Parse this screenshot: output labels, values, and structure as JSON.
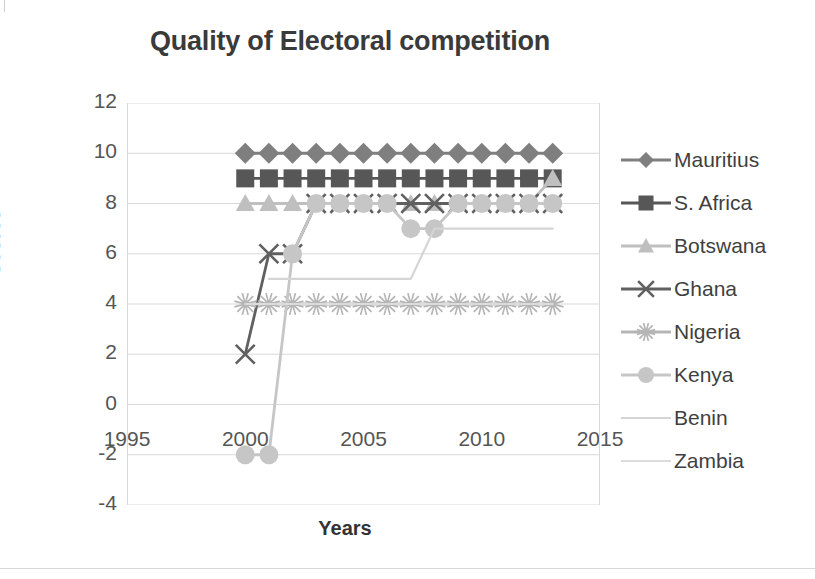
{
  "chart_data": {
    "type": "line",
    "title": "Quality of Electoral competition",
    "xlabel": "Years",
    "ylabel": "Scores",
    "xlim": [
      1995,
      2015
    ],
    "ylim": [
      -4,
      12
    ],
    "xticks": [
      "1995",
      "2000",
      "2005",
      "2010",
      "2015"
    ],
    "yticks": [
      "12",
      "10",
      "8",
      "6",
      "4",
      "2",
      "0",
      "-2",
      "-4"
    ],
    "grid": "horizontal",
    "legend_position": "right",
    "series": [
      {
        "name": "Mauritius",
        "marker": "diamond",
        "color": "#7f7f7f",
        "x": [
          2000,
          2001,
          2002,
          2003,
          2004,
          2005,
          2006,
          2007,
          2008,
          2009,
          2010,
          2011,
          2012,
          2013
        ],
        "values": [
          10,
          10,
          10,
          10,
          10,
          10,
          10,
          10,
          10,
          10,
          10,
          10,
          10,
          10
        ]
      },
      {
        "name": "S. Africa",
        "marker": "square",
        "color": "#575757",
        "x": [
          2000,
          2001,
          2002,
          2003,
          2004,
          2005,
          2006,
          2007,
          2008,
          2009,
          2010,
          2011,
          2012,
          2013
        ],
        "values": [
          9,
          9,
          9,
          9,
          9,
          9,
          9,
          9,
          9,
          9,
          9,
          9,
          9,
          9
        ]
      },
      {
        "name": "Botswana",
        "marker": "triangle",
        "color": "#bfbfbf",
        "x": [
          2000,
          2001,
          2002,
          2003,
          2004,
          2005,
          2006,
          2007,
          2008,
          2009,
          2010,
          2011,
          2012,
          2013
        ],
        "values": [
          8,
          8,
          8,
          8,
          8,
          8,
          8,
          8,
          8,
          8,
          8,
          8,
          8,
          9
        ]
      },
      {
        "name": "Ghana",
        "marker": "cross",
        "color": "#606060",
        "x": [
          2000,
          2001,
          2002,
          2003,
          2004,
          2005,
          2006,
          2007,
          2008,
          2009,
          2010,
          2011,
          2012,
          2013
        ],
        "values": [
          2,
          6,
          6,
          8,
          8,
          8,
          8,
          8,
          8,
          8,
          8,
          8,
          8,
          8
        ]
      },
      {
        "name": "Nigeria",
        "marker": "asterisk",
        "color": "#b5b5b5",
        "x": [
          2000,
          2001,
          2002,
          2003,
          2004,
          2005,
          2006,
          2007,
          2008,
          2009,
          2010,
          2011,
          2012,
          2013
        ],
        "values": [
          4,
          4,
          4,
          4,
          4,
          4,
          4,
          4,
          4,
          4,
          4,
          4,
          4,
          4
        ]
      },
      {
        "name": "Kenya",
        "marker": "circle",
        "color": "#c6c6c6",
        "x": [
          2000,
          2001,
          2002,
          2003,
          2004,
          2005,
          2006,
          2007,
          2008,
          2009,
          2010,
          2011,
          2012,
          2013
        ],
        "values": [
          -2,
          -2,
          6,
          8,
          8,
          8,
          8,
          7,
          7,
          8,
          8,
          8,
          8,
          8
        ]
      },
      {
        "name": "Benin",
        "marker": "none",
        "color": "#d5d5d5",
        "x": [
          2001,
          2002,
          2003,
          2004,
          2005,
          2006,
          2007,
          2008,
          2009,
          2010,
          2011,
          2012,
          2013
        ],
        "values": [
          5,
          5,
          5,
          5,
          5,
          5,
          5,
          7,
          7,
          7,
          7,
          7,
          7
        ]
      },
      {
        "name": "Zambia",
        "marker": "none",
        "color": "#dcdcdc",
        "x": [
          2000,
          2001,
          2002,
          2003,
          2004,
          2005,
          2006,
          2007,
          2008,
          2009,
          2010,
          2011,
          2012,
          2013
        ],
        "values": [
          4,
          4,
          4,
          4,
          4,
          4,
          4,
          4,
          4,
          4,
          4,
          4,
          4,
          4
        ]
      }
    ]
  }
}
